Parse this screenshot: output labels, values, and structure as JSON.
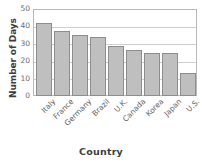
{
  "chart_data": {
    "type": "bar",
    "title": "",
    "xlabel": "Country",
    "ylabel": "Number of Days",
    "categories": [
      "Italy",
      "France",
      "Germany",
      "Brazil",
      "U.K.",
      "Canada",
      "Korea",
      "Japan",
      "U.S."
    ],
    "values": [
      42,
      37.5,
      35,
      34,
      28.5,
      26.5,
      25,
      25,
      13
    ],
    "ylim": [
      0,
      50
    ],
    "ytick_labels": [
      "50",
      "40",
      "30",
      "20",
      "10",
      "0"
    ],
    "ytick_values": [
      50,
      40,
      30,
      20,
      10,
      0
    ],
    "grid": "horizontal",
    "legend": "none",
    "bar_color": "#bfbfbf",
    "bar_edge_color": "#8d8d8d",
    "grid_color": "#cfcfcf",
    "frame_color": "#b9b9b9"
  },
  "axes": {
    "y_title": "Number of Days",
    "x_title": "Country"
  },
  "title_sliver": ""
}
